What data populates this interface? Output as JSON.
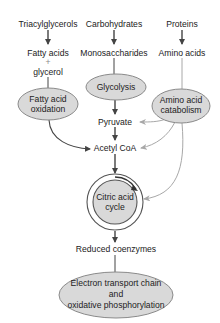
{
  "diagram": {
    "colors": {
      "node_fill": "#d9d9d9",
      "node_stroke": "#8a8a8a",
      "main_arrow": "#444444",
      "secondary_arrow": "#a8a8a8",
      "text": "#222222"
    },
    "sources": {
      "triacylglycerols": "Triacylglycerols",
      "carbohydrates": "Carbohydrates",
      "proteins": "Proteins"
    },
    "monomers": {
      "fatty_acids": "Fatty acids",
      "plus": "+",
      "glycerol": "glycerol",
      "monosaccharides": "Monosaccharides",
      "amino_acids": "Amino acids"
    },
    "processes": {
      "fatty_acid_oxidation": [
        "Fatty acid",
        "oxidation"
      ],
      "glycolysis": "Glycolysis",
      "amino_acid_catabolism": [
        "Amino acid",
        "catabolism"
      ],
      "citric_acid_cycle": [
        "Citric acid",
        "cycle"
      ],
      "electron_transport": [
        "Electron transport chain",
        "and",
        "oxidative phosphorylation"
      ]
    },
    "intermediates": {
      "pyruvate": "Pyruvate",
      "acetyl_coa": "Acetyl CoA",
      "reduced_coenzymes": "Reduced coenzymes"
    },
    "edges": [
      {
        "from": "Triacylglycerols",
        "to": "Fatty acids + glycerol"
      },
      {
        "from": "Carbohydrates",
        "to": "Monosaccharides"
      },
      {
        "from": "Proteins",
        "to": "Amino acids"
      },
      {
        "from": "Fatty acids + glycerol",
        "to": "Fatty acid oxidation"
      },
      {
        "from": "Monosaccharides",
        "to": "Glycolysis"
      },
      {
        "from": "Amino acids",
        "to": "Amino acid catabolism"
      },
      {
        "from": "Glycolysis",
        "to": "Pyruvate"
      },
      {
        "from": "Pyruvate",
        "to": "Acetyl CoA"
      },
      {
        "from": "Fatty acid oxidation",
        "to": "Acetyl CoA"
      },
      {
        "from": "Amino acid catabolism",
        "to": "Pyruvate"
      },
      {
        "from": "Amino acid catabolism",
        "to": "Acetyl CoA"
      },
      {
        "from": "Amino acid catabolism",
        "to": "Citric acid cycle"
      },
      {
        "from": "Acetyl CoA",
        "to": "Citric acid cycle"
      },
      {
        "from": "Citric acid cycle",
        "to": "Reduced coenzymes"
      },
      {
        "from": "Reduced coenzymes",
        "to": "Electron transport chain and oxidative phosphorylation"
      }
    ]
  }
}
